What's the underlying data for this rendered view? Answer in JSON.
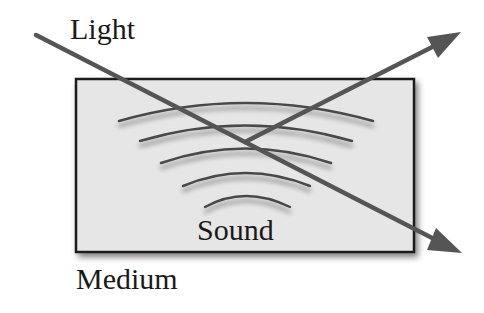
{
  "diagram": {
    "labels": {
      "light": "Light",
      "sound": "Sound",
      "medium": "Medium"
    },
    "colors": {
      "background": "#ffffff",
      "medium_fill": "#e6e6e6",
      "medium_border": "#1a1a1a",
      "arrow": "#555555",
      "arc": "#4a4a4a",
      "text": "#1a1a1a"
    },
    "elements": {
      "medium_box": "rectangle representing a medium",
      "sound_waves": "5 concentric arcs radiating upward",
      "light_ray_incident": "line entering from upper left",
      "light_ray_reflected": "arrow exiting to upper right",
      "light_ray_transmitted": "arrow exiting to lower right"
    }
  }
}
